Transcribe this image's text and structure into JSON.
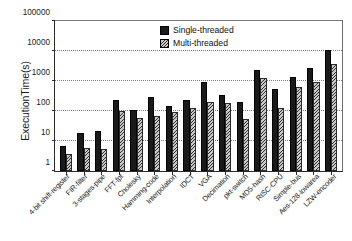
{
  "chart_data": {
    "type": "bar",
    "title": "",
    "xlabel": "",
    "ylabel": "ExecutionTime(s)",
    "yscale": "log",
    "ylim": [
      1,
      100000
    ],
    "yticks": [
      1,
      10,
      100,
      1000,
      10000,
      100000
    ],
    "ytick_labels": [
      "1",
      "10",
      "100",
      "1000",
      "10000",
      "100000"
    ],
    "grid": true,
    "legend_position": "top-center",
    "categories": [
      "4-bit shift-register",
      "FIR-filter",
      "3-stages-pipe",
      "FFT-fpt",
      "Cholesky",
      "Hamming-code",
      "Interpolation",
      "IDCT",
      "VGA",
      "Decimation",
      "pkt-switch",
      "MD5-hash",
      "RISC-CPU",
      "Simple-bus",
      "Aes-128-lowarea",
      "LZW-encoder"
    ],
    "series": [
      {
        "name": "Single-threaded",
        "color": "#1a1a1a",
        "values": [
          7,
          19,
          21,
          240,
          110,
          300,
          150,
          240,
          900,
          350,
          205,
          2300,
          560,
          1350,
          2800,
          10500
        ]
      },
      {
        "name": "Multi-threaded",
        "color": "#c9c9c9",
        "values": [
          3.7,
          6.0,
          5.4,
          100,
          60,
          66,
          90,
          130,
          205,
          190,
          56,
          1250,
          125,
          610,
          900,
          3600
        ]
      }
    ]
  }
}
